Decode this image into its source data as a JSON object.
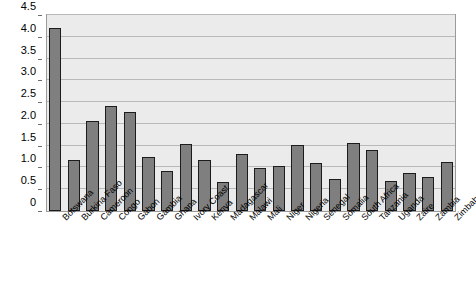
{
  "chart_data": {
    "type": "bar",
    "title": "",
    "subtitle": "",
    "xlabel": "",
    "ylabel": "",
    "ylim": [
      0,
      4.5
    ],
    "grid": true,
    "legend": "none",
    "y_ticks": [
      "0",
      "0.5",
      "1.0",
      "1.5",
      "2.0",
      "2.5",
      "3.0",
      "3.5",
      "4.0",
      "4.5"
    ],
    "y_tick_values": [
      0,
      0.5,
      1.0,
      1.5,
      2.0,
      2.5,
      3.0,
      3.5,
      4.0,
      4.5
    ],
    "categories": [
      "Botswana",
      "Burkina Faso",
      "Cameroon",
      "Congo",
      "Gabon",
      "Gambia",
      "Ghana",
      "Ivory Coast",
      "Kenya",
      "Madagascar",
      "Malawi",
      "Mali",
      "Niger",
      "Nigeria",
      "Senegal",
      "Somalia",
      "South Africa",
      "Tanzania",
      "Uganda",
      "Zaire",
      "Zambia",
      "Zimbabwe"
    ],
    "values": [
      4.21,
      1.18,
      2.06,
      2.4,
      2.27,
      1.24,
      0.91,
      1.53,
      1.18,
      0.66,
      1.32,
      0.98,
      1.04,
      1.52,
      1.1,
      0.73,
      1.56,
      1.41,
      0.69,
      0.87,
      0.78,
      1.12
    ],
    "colors": {
      "bar_fill": "#7f7f7f",
      "bar_border": "#1c1c1c",
      "plot_background": "#ebebeb",
      "gridline": "#b9b9b9",
      "frame": "#9a9a9a",
      "text": "#000000"
    }
  }
}
